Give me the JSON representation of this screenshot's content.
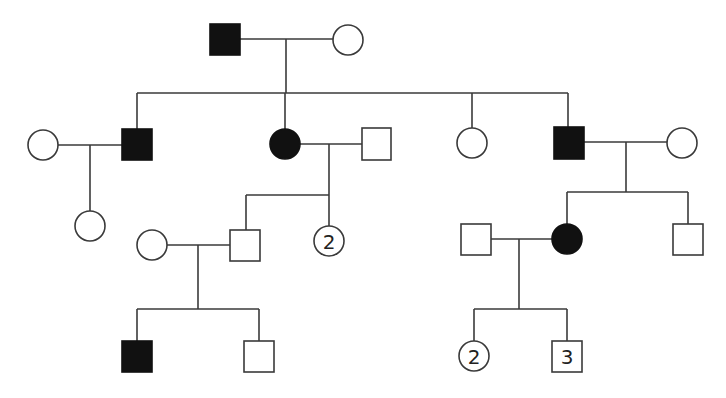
{
  "diagram": {
    "type": "pedigree-chart",
    "colors": {
      "affected": "#111111",
      "unaffected": "#ffffff",
      "line": "#3a3a3a"
    },
    "legend_semantics": {
      "square": "male",
      "circle": "female",
      "filled": "affected",
      "open": "unaffected",
      "number_inside": "number of individuals"
    },
    "generations": [
      {
        "label": "I",
        "individuals": [
          {
            "id": "I-1",
            "sex": "male",
            "affected": true
          },
          {
            "id": "I-2",
            "sex": "female",
            "affected": false
          }
        ]
      },
      {
        "label": "II",
        "individuals": [
          {
            "id": "II-1",
            "sex": "female",
            "affected": false,
            "note": "spouse of II-2"
          },
          {
            "id": "II-2",
            "sex": "male",
            "affected": true,
            "parents": "I-1 x I-2"
          },
          {
            "id": "II-3",
            "sex": "female",
            "affected": true,
            "parents": "I-1 x I-2"
          },
          {
            "id": "II-4",
            "sex": "male",
            "affected": false,
            "note": "spouse of II-3"
          },
          {
            "id": "II-5",
            "sex": "female",
            "affected": false,
            "parents": "I-1 x I-2"
          },
          {
            "id": "II-6",
            "sex": "male",
            "affected": true,
            "parents": "I-1 x I-2"
          },
          {
            "id": "II-7",
            "sex": "female",
            "affected": false,
            "note": "spouse of II-6"
          }
        ]
      },
      {
        "label": "III",
        "individuals": [
          {
            "id": "III-1",
            "sex": "female",
            "affected": false,
            "parents": "II-1 x II-2"
          },
          {
            "id": "III-2",
            "sex": "female",
            "affected": false,
            "note": "spouse of III-3"
          },
          {
            "id": "III-3",
            "sex": "male",
            "affected": false,
            "parents": "II-3 x II-4"
          },
          {
            "id": "III-4",
            "sex": "female",
            "affected": false,
            "count": "2",
            "parents": "II-3 x II-4"
          },
          {
            "id": "III-5",
            "sex": "male",
            "affected": false,
            "note": "spouse of III-6"
          },
          {
            "id": "III-6",
            "sex": "female",
            "affected": true,
            "parents": "II-6 x II-7"
          },
          {
            "id": "III-7",
            "sex": "male",
            "affected": false,
            "parents": "II-6 x II-7"
          }
        ]
      },
      {
        "label": "IV",
        "individuals": [
          {
            "id": "IV-1",
            "sex": "male",
            "affected": true,
            "parents": "III-2 x III-3"
          },
          {
            "id": "IV-2",
            "sex": "male",
            "affected": false,
            "parents": "III-2 x III-3"
          },
          {
            "id": "IV-3",
            "sex": "female",
            "affected": false,
            "count": "2",
            "parents": "III-5 x III-6"
          },
          {
            "id": "IV-4",
            "sex": "male",
            "affected": false,
            "count": "3",
            "parents": "III-5 x III-6"
          }
        ]
      }
    ],
    "counts": {
      "III-4": "2",
      "IV-3": "2",
      "IV-4": "3"
    }
  }
}
